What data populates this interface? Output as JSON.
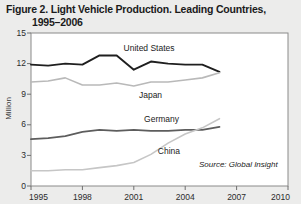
{
  "figure": {
    "title_line1": "Figure 2. Light Vehicle Production. Leading Countries,",
    "title_line2": "1995–2006",
    "source": "Source: Global Insight",
    "background_color": "#ececeb",
    "plot_background_color": "#ffffff"
  },
  "chart_data": {
    "type": "line",
    "title": "Figure 2. Light Vehicle Production. Leading Countries, 1995–2006",
    "xlabel": "",
    "ylabel": "Million",
    "xlim": [
      1995,
      2010
    ],
    "ylim": [
      0,
      15
    ],
    "yticks": [
      0,
      3,
      6,
      9,
      12,
      15
    ],
    "xticks": [
      1995,
      1998,
      2001,
      2004,
      2007,
      2010
    ],
    "grid": false,
    "legend": "inline-labels",
    "x": [
      1995,
      1996,
      1997,
      1998,
      1999,
      2000,
      2001,
      2002,
      2003,
      2004,
      2005,
      2006
    ],
    "series": [
      {
        "name": "United States",
        "color": "#1f1f1f",
        "width": 1.9,
        "values": [
          11.9,
          11.8,
          12.0,
          11.9,
          12.8,
          12.8,
          11.4,
          12.2,
          12.0,
          11.9,
          11.9,
          11.2
        ],
        "label_x": 2000.4,
        "label_y": 13.5
      },
      {
        "name": "Japan",
        "color": "#b9b9b9",
        "width": 1.6,
        "values": [
          10.2,
          10.3,
          10.6,
          9.9,
          9.9,
          10.1,
          9.8,
          10.2,
          10.2,
          10.4,
          10.6,
          11.1
        ],
        "label_x": 2001.3,
        "label_y": 8.9
      },
      {
        "name": "Germany",
        "color": "#5d5d5d",
        "width": 1.8,
        "values": [
          4.6,
          4.7,
          4.9,
          5.3,
          5.5,
          5.4,
          5.5,
          5.4,
          5.4,
          5.5,
          5.5,
          5.8
        ],
        "label_x": 2001.6,
        "label_y": 6.55
      },
      {
        "name": "China",
        "color": "#c6c6c6",
        "width": 1.6,
        "values": [
          1.5,
          1.5,
          1.6,
          1.6,
          1.8,
          2.0,
          2.3,
          3.1,
          4.2,
          5.1,
          5.7,
          6.6
        ],
        "label_x": 2002.4,
        "label_y": 3.35
      }
    ]
  }
}
